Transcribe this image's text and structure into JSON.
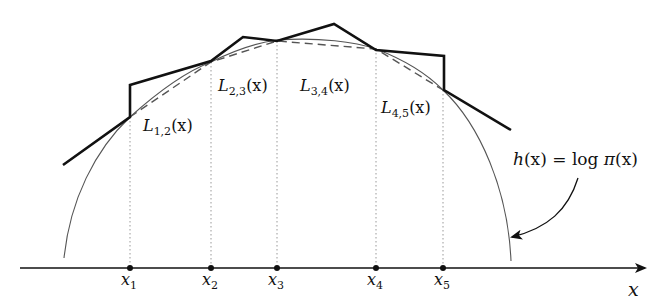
{
  "figure": {
    "axis_label": "x",
    "curve_label": {
      "lhs_fn": "h",
      "lhs_arg": "(x)",
      "equals": " = ",
      "log": "log ",
      "pi": "π",
      "rhs_arg": "(x)"
    },
    "points": [
      {
        "name": "x",
        "sub": "1",
        "px": 130
      },
      {
        "name": "x",
        "sub": "2",
        "px": 211
      },
      {
        "name": "x",
        "sub": "3",
        "px": 277
      },
      {
        "name": "x",
        "sub": "4",
        "px": 376
      },
      {
        "name": "x",
        "sub": "5",
        "px": 443
      }
    ],
    "segment_labels": [
      {
        "name": "L",
        "sub": "1,2",
        "arg": "(x)"
      },
      {
        "name": "L",
        "sub": "2,3",
        "arg": "(x)"
      },
      {
        "name": "L",
        "sub": "3,4",
        "arg": "(x)"
      },
      {
        "name": "L",
        "sub": "4,5",
        "arg": "(x)"
      }
    ],
    "colors": {
      "ink": "#111111",
      "curve": "#555555",
      "dotted": "#999999"
    }
  }
}
